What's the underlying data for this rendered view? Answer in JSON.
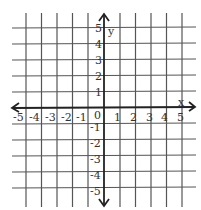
{
  "diagram": {
    "type": "coordinate-plane",
    "x_axis": {
      "label": "x",
      "ticks": [
        "-5",
        "-4",
        "-3",
        "-2",
        "-1",
        "0",
        "1",
        "2",
        "3",
        "4",
        "5"
      ]
    },
    "y_axis": {
      "label": "y",
      "ticks": [
        "5",
        "4",
        "3",
        "2",
        "1",
        "-1",
        "-2",
        "-3",
        "-4",
        "-5"
      ]
    },
    "origin_label": "0",
    "colors": {
      "grid": "#444444",
      "axis": "#222222",
      "background": "#ffffff"
    }
  }
}
